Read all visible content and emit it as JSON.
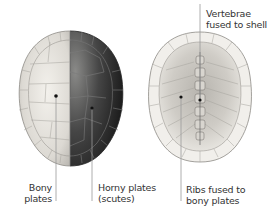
{
  "figure": {
    "panels": [
      {
        "name": "carapace-exterior",
        "description": "Top view of shell: left half bony plates, right half horny plates"
      },
      {
        "name": "carapace-interior",
        "description": "Underside view of shell showing fused vertebrae and ribs"
      }
    ]
  },
  "labels": {
    "bony_line1": "Bony",
    "bony_line2": "plates",
    "horny_line1": "Horny plates",
    "horny_line2": "(scutes)",
    "ribs_line1": "Ribs fused to",
    "ribs_line2": "bony plates",
    "vert_line1": "Vertebrae",
    "vert_line2": "fused to shell"
  },
  "colors": {
    "bony": "#e6e3dd",
    "horny": "#3b3b3b",
    "interior": "#d9d6d1",
    "leader": "#999999",
    "text": "#333333"
  }
}
